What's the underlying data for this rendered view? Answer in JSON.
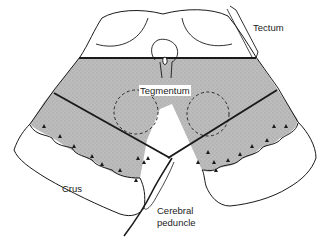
{
  "diagram": {
    "labels": {
      "tectum": "Tectum",
      "tegmentum": "Tegmentum",
      "crus": "Crus",
      "cerebral_peduncle_line1": "Cerebral",
      "cerebral_peduncle_line2": "peduncle"
    },
    "colors": {
      "stroke": "#1a1a1a",
      "shaded_region": "#b8b8b8",
      "background": "#ffffff"
    }
  }
}
